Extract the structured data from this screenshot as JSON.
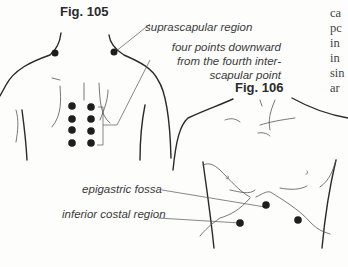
{
  "figures": {
    "fig105": {
      "title": "Fig. 105"
    },
    "fig106": {
      "title": "Fig. 106"
    }
  },
  "labels": {
    "suprascapular": "suprascapular region",
    "four_points_1": "four points downward",
    "four_points_2": "from the fourth inter-",
    "four_points_3": "scapular point",
    "epigastric": "epigastric fossa",
    "inferior_costal": "inferior costal region"
  },
  "side_text": [
    "ca",
    "pc",
    "in",
    "in",
    "sin",
    "ar"
  ],
  "colors": {
    "ink": "#2a2a2a",
    "point": "#1e1e1e"
  }
}
